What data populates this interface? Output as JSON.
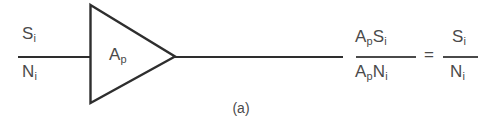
{
  "figure": {
    "caption": "(a)",
    "ink_color": "#2e2e2e",
    "text_color": "#4a4a4a",
    "background_color": "#ffffff"
  },
  "input": {
    "numerator": "S",
    "numerator_sub": "i",
    "denominator": "N",
    "denominator_sub": "i"
  },
  "amplifier": {
    "gain_symbol": "A",
    "gain_sub": "p",
    "shape": "triangle-amplifier"
  },
  "output": {
    "numerator_a": "A",
    "numerator_a_sub": "p",
    "numerator_b": "S",
    "numerator_b_sub": "i",
    "denominator_a": "A",
    "denominator_a_sub": "p",
    "denominator_b": "N",
    "denominator_b_sub": "i"
  },
  "relation": {
    "operator": "=",
    "numerator": "S",
    "numerator_sub": "i",
    "denominator": "N",
    "denominator_sub": "i"
  }
}
